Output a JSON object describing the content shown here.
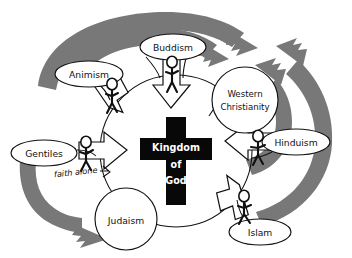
{
  "diagram": {
    "center": {
      "name": "center-cross",
      "line1": "Kingdom",
      "line2": "of",
      "line3": "God",
      "shape": "cross-icon",
      "fill": "#080808",
      "text_color": "#ffffff"
    },
    "nodes": [
      {
        "id": "buddism",
        "label": "Buddism",
        "shape": "ellipse",
        "position": "top"
      },
      {
        "id": "animism",
        "label": "Animism",
        "shape": "ellipse",
        "position": "top-left"
      },
      {
        "id": "western",
        "label_line1": "Western",
        "label_line2": "Christianity",
        "label": "Western Christianity",
        "shape": "circle",
        "position": "right-upper"
      },
      {
        "id": "hinduism",
        "label": "Hinduism",
        "shape": "ellipse",
        "position": "right"
      },
      {
        "id": "islam",
        "label": "Islam",
        "shape": "ellipse",
        "position": "bottom-right"
      },
      {
        "id": "judaism",
        "label": "Judaism",
        "shape": "circle",
        "position": "bottom-left"
      },
      {
        "id": "gentiles",
        "label": "Gentiles",
        "shape": "ellipse",
        "position": "left"
      }
    ],
    "annotations": [
      {
        "id": "faith-alone",
        "label": "faith alone",
        "style": "handwritten-italic",
        "attached_to": "gentiles"
      }
    ],
    "inward_arrows": [
      {
        "from": "animism",
        "to": "center",
        "style": "white-outline",
        "direction": "down-right"
      },
      {
        "from": "buddism",
        "to": "center",
        "style": "white-outline",
        "direction": "down"
      },
      {
        "from": "gentiles",
        "to": "center",
        "style": "white-outline",
        "direction": "right"
      },
      {
        "from": "hinduism",
        "to": "center",
        "style": "white-outline",
        "direction": "left"
      },
      {
        "from": "islam",
        "to": "center",
        "style": "white-outline",
        "direction": "up-left"
      }
    ],
    "flow_arrows": [
      {
        "id": "flow-left-to-topright-outer",
        "style": "gray-thick",
        "color": "#787878"
      },
      {
        "id": "flow-left-to-topright-inner",
        "style": "gray-thick",
        "color": "#787878"
      },
      {
        "id": "flow-right-outer-up",
        "style": "gray-thick",
        "color": "#787878"
      },
      {
        "id": "flow-right-inner-up",
        "style": "gray-thick",
        "color": "#787878"
      },
      {
        "id": "flow-gentiles-to-judaism",
        "style": "gray-thick",
        "color": "#787878"
      }
    ],
    "figures": [
      {
        "id": "figure-animism",
        "attached_to": "animism"
      },
      {
        "id": "figure-buddism",
        "attached_to": "buddism"
      },
      {
        "id": "figure-gentiles",
        "attached_to": "gentiles"
      },
      {
        "id": "figure-hinduism",
        "attached_to": "hinduism"
      },
      {
        "id": "figure-islam",
        "attached_to": "islam"
      }
    ],
    "colors": {
      "background": "#ffffff",
      "stroke": "#111111",
      "gray_arrow": "#787878",
      "cross": "#080808"
    }
  }
}
